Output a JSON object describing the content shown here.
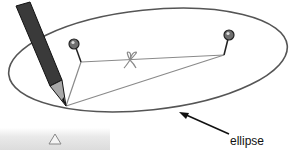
{
  "diagram": {
    "labels": {
      "ellipse": "ellipse"
    },
    "elements": {
      "ellipse": {
        "cx": 148,
        "cy": 60,
        "rx": 140,
        "ry": 50,
        "rotate": -6,
        "stroke": "#555555"
      },
      "pin_left": {
        "head": [
          74,
          44
        ],
        "base": [
          81,
          62
        ],
        "color": "#6f6f6f"
      },
      "pin_right": {
        "head": [
          229,
          35
        ],
        "base": [
          224,
          55
        ],
        "color": "#6f6f6f"
      },
      "pencil_tip": [
        66,
        106
      ],
      "string_color": "#8a8a8a",
      "pencil_color": "#3a3a3a",
      "arrow": {
        "from": [
          229,
          134
        ],
        "to": [
          180,
          112
        ]
      }
    }
  },
  "ui": {
    "scroll_button": {
      "icon": "up-triangle-icon"
    }
  }
}
